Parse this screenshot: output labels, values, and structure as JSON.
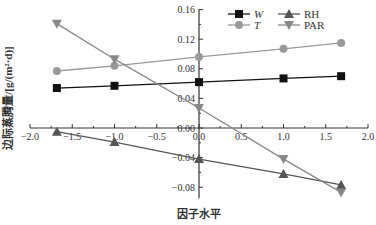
{
  "chart_data": {
    "type": "line",
    "title": "",
    "xlabel": "因子水平",
    "ylabel": "边际蒸腾量/[g/(m²·d)]",
    "xlim": [
      -2.0,
      2.0
    ],
    "ylim": [
      -0.09,
      0.16
    ],
    "xticks": [
      "-2.0",
      "-1.5",
      "-1.0",
      "-0.5",
      "0.0",
      "0.5",
      "1.0",
      "1.5",
      "2.0"
    ],
    "yticks": [
      "0.16",
      "0.12",
      "0.08",
      "0.04",
      "0.00",
      "-0.04",
      "-0.08"
    ],
    "grid": false,
    "legend_position": "top-right",
    "x": [
      -1.682,
      -1,
      0,
      1,
      1.682
    ],
    "series": [
      {
        "name": "W",
        "marker": "square",
        "color": "#111111",
        "values": [
          0.054,
          0.057,
          0.062,
          0.067,
          0.07
        ]
      },
      {
        "name": "T",
        "marker": "circle",
        "color": "#999999",
        "values": [
          0.077,
          0.084,
          0.096,
          0.107,
          0.115
        ]
      },
      {
        "name": "RH",
        "marker": "triangle-up",
        "color": "#555555",
        "values": [
          -0.005,
          -0.019,
          -0.042,
          -0.062,
          -0.077
        ]
      },
      {
        "name": "PAR",
        "marker": "triangle-down",
        "color": "#888888",
        "values": [
          0.141,
          0.093,
          0.027,
          -0.042,
          -0.087
        ]
      }
    ]
  }
}
